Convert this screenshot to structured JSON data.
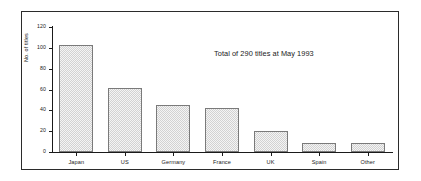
{
  "chart_data": {
    "type": "bar",
    "title": "",
    "subtitle": "",
    "xlabel": "",
    "ylabel": "No. of titles",
    "categories": [
      "Japan",
      "US",
      "Germany",
      "France",
      "UK",
      "Spain",
      "Other"
    ],
    "values": [
      103,
      61,
      45,
      42,
      20,
      9,
      9
    ],
    "series": [
      {
        "name": "No. of titles",
        "values": [
          103,
          61,
          45,
          42,
          20,
          9,
          9
        ]
      }
    ],
    "ylim": [
      0,
      120
    ],
    "yticks": [
      0,
      20,
      40,
      60,
      80,
      100,
      120
    ],
    "ytick_labels": [
      "0",
      "20",
      "40",
      "60",
      "80",
      "100",
      "120"
    ],
    "grid": false,
    "legend": false,
    "legend_position": "none",
    "annotations": [
      {
        "text": "Total of 290 titles at May 1993",
        "position": "upper-right"
      }
    ],
    "bar_fill_color": "#e8e8e8",
    "bar_edge_color": "#7a7a7a",
    "axis_color": "#1a1a1a",
    "background_color": "#ffffff",
    "frame_color": "#2b2b2b"
  }
}
